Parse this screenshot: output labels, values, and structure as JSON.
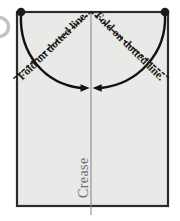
{
  "diagram": {
    "labels": {
      "fold_left": "Fold on dotted line.",
      "fold_right": "Fold on dotted line.",
      "crease": "Crease"
    },
    "colors": {
      "paper_fill": "#e9e9e7",
      "paper_border": "#2b2b2b",
      "curve": "#111111",
      "dotted_line": "#1a1a1a",
      "crease_line": "#888888",
      "corner_dot": "#1a1a1a",
      "label_text": "#1b1b1b",
      "crease_text": "#6d6d6d",
      "background": "#ffffff",
      "ghost_circle": "#c9c9c9"
    },
    "geometry": {
      "paper_left": 17,
      "paper_right": 168,
      "paper_top": 12,
      "paper_bottom": 206,
      "crease_x": 91,
      "apex_x": 91,
      "apex_y": 12,
      "meet_x": 91,
      "meet_y": 88,
      "dot_radius": 4.2,
      "left_dot": [
        21,
        12
      ],
      "right_dot": [
        165,
        12
      ],
      "dotted_left_end": [
        13,
        79
      ],
      "dotted_right_end": [
        170,
        79
      ]
    },
    "elements": {
      "paper_sheet": "rectangular sheet of paper",
      "crease_line": "vertical center crease",
      "dotted_fold_left": "left diagonal dotted fold line",
      "dotted_fold_right": "right diagonal dotted fold line",
      "curve_left": "left curved fold arrow",
      "curve_right": "right curved fold arrow",
      "arrowhead_left": "left arrowhead pointing right",
      "arrowhead_right": "right arrowhead pointing left",
      "corner_dot_left": "top-left corner marker dot",
      "corner_dot_right": "top-right corner marker dot",
      "ghost_circle": "partially cropped circle at left margin"
    }
  }
}
